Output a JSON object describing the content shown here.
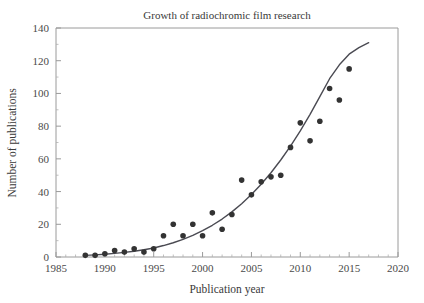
{
  "chart_data": {
    "type": "scatter",
    "title": "Growth of radiochromic film research",
    "xlabel": "Publication year",
    "ylabel": "Number of publications",
    "xlim": [
      1985,
      2020
    ],
    "ylim": [
      0,
      140
    ],
    "xticks": [
      1985,
      1990,
      1995,
      2000,
      2005,
      2010,
      2015,
      2020
    ],
    "xtick_labels": [
      "1985",
      "1990",
      "1995",
      "2000",
      "2005",
      "2010",
      "2015",
      "2020"
    ],
    "yticks": [
      0,
      20,
      40,
      60,
      80,
      100,
      120,
      140
    ],
    "ytick_labels": [
      "0",
      "20",
      "40",
      "60",
      "80",
      "100",
      "120",
      "140"
    ],
    "x_minor_tick_step": 1,
    "y_minor_tick_step": 10,
    "grid": false,
    "legend": "none",
    "marker_color": "#333333",
    "line_color": "#4a4a52",
    "axis_color": "#9a9a9a",
    "background_color": "#ffffff",
    "x": [
      1988,
      1989,
      1990,
      1991,
      1992,
      1993,
      1994,
      1995,
      1996,
      1997,
      1998,
      1999,
      2000,
      2001,
      2002,
      2003,
      2004,
      2005,
      2006,
      2007,
      2008,
      2009,
      2010,
      2011,
      2012,
      2013,
      2014,
      2015
    ],
    "values": [
      1,
      1,
      2,
      4,
      3,
      5,
      3,
      5,
      13,
      20,
      13,
      20,
      13,
      27,
      17,
      26,
      47,
      38,
      46,
      49,
      50,
      67,
      82,
      71,
      83,
      103,
      96,
      115
    ],
    "fit_curve": {
      "name": "exponential trend line",
      "x_start": 1988,
      "x_end": 2017,
      "y_start": 1,
      "y_end": 131,
      "points_x": [
        1988,
        1989,
        1990,
        1991,
        1992,
        1993,
        1994,
        1995,
        1996,
        1997,
        1998,
        1999,
        2000,
        2001,
        2002,
        2003,
        2004,
        2005,
        2006,
        2007,
        2008,
        2009,
        2010,
        2011,
        2012,
        2013,
        2014,
        2015,
        2016,
        2017
      ],
      "points_y": [
        1.0,
        1.3,
        1.7,
        2.2,
        2.8,
        3.5,
        4.4,
        5.5,
        7.0,
        8.7,
        10.8,
        13.2,
        16.1,
        19.4,
        23.2,
        27.6,
        32.6,
        38.2,
        44.5,
        51.5,
        59.3,
        67.8,
        77.1,
        87.2,
        98.0,
        109.0,
        117.5,
        124.0,
        128.0,
        131.0
      ]
    }
  }
}
